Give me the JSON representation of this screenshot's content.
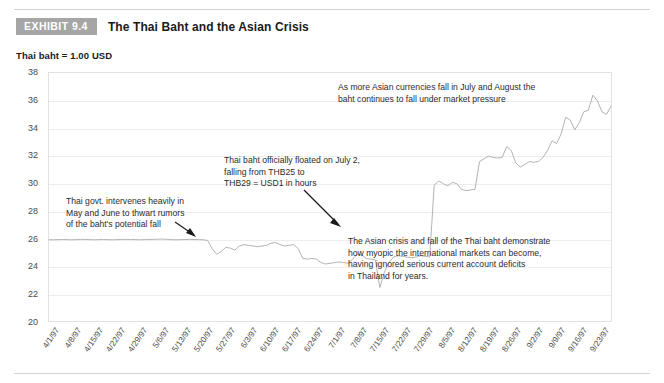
{
  "header": {
    "badge": "EXHIBIT 9.4",
    "title": "The Thai Baht and the Asian Crisis"
  },
  "axis_unit_label": "Thai baht = 1.00 USD",
  "annotations": {
    "july_august": "As more Asian currencies fall in July and August the\nbaht continues to fall under market pressure",
    "float": "Thai baht officially floated on July 2,\nfalling from THB25 to\nTHB29 = USD1 in hours",
    "intervene": "Thai govt. intervenes heavily in\nMay and June to thwart rumors\nof the baht's potential fall",
    "myopic": "The Asian crisis and fall of the Thai baht demonstrate\nhow myopic the international markets can become,\nhaving ignored serious current account deficits\nin Thailand for years."
  },
  "chart_data": {
    "type": "line",
    "title": "The Thai Baht and the Asian Crisis",
    "xlabel": "",
    "ylabel": "Thai baht = 1.00 USD",
    "ylim": [
      20,
      38
    ],
    "ytick_step": 2,
    "yticks": [
      20,
      22,
      24,
      26,
      28,
      30,
      32,
      34,
      36,
      38
    ],
    "grid": true,
    "legend": "none",
    "line_color": "#b3b3b3",
    "xtick_labels": [
      "4/1/97",
      "4/8/97",
      "4/15/97",
      "4/22/97",
      "4/29/97",
      "5/6/97",
      "5/13/97",
      "5/20/97",
      "5/27/97",
      "6/3/97",
      "6/10/97",
      "6/17/97",
      "6/24/97",
      "7/1/97",
      "7/8/97",
      "7/15/97",
      "7/22/97",
      "7/29/97",
      "8/5/97",
      "8/12/97",
      "8/19/97",
      "8/26/97",
      "9/2/97",
      "9/9/97",
      "9/16/97",
      "9/23/97"
    ],
    "x": [
      0,
      1,
      2,
      3,
      4,
      5,
      6,
      7,
      8,
      9,
      10,
      11,
      12,
      13,
      14,
      15,
      16,
      17,
      18,
      19,
      20,
      21,
      22,
      23,
      24,
      25,
      26,
      27,
      28,
      29,
      30,
      31,
      32,
      33,
      34,
      35,
      36,
      37,
      38,
      39,
      40,
      41,
      42,
      43,
      44,
      45,
      46,
      47,
      48,
      49,
      50,
      51,
      52,
      53,
      54,
      55,
      56,
      57,
      58,
      59,
      60,
      61,
      62,
      63,
      64,
      65,
      66,
      67,
      68,
      69,
      70,
      71,
      72,
      73,
      74,
      75,
      76,
      77,
      78,
      79,
      80,
      81,
      82,
      83,
      84,
      85,
      86,
      87,
      88,
      89,
      90,
      91,
      92,
      93,
      94,
      95,
      96,
      97,
      98,
      99,
      100,
      101,
      102,
      103,
      104,
      105,
      106,
      107,
      108,
      109,
      110,
      111,
      112,
      113,
      114,
      115,
      116,
      117,
      118,
      119,
      120,
      121,
      122,
      123,
      124
    ],
    "values": [
      25.95,
      25.95,
      25.96,
      25.97,
      25.96,
      25.95,
      25.96,
      25.98,
      25.97,
      25.96,
      25.95,
      25.96,
      25.97,
      25.96,
      25.95,
      25.96,
      25.97,
      25.98,
      25.97,
      25.96,
      25.95,
      25.96,
      25.97,
      25.98,
      25.99,
      26.0,
      25.98,
      25.96,
      25.95,
      25.96,
      25.97,
      25.98,
      25.97,
      25.96,
      25.95,
      25.9,
      25.3,
      24.9,
      25.1,
      25.4,
      25.35,
      25.2,
      25.5,
      25.6,
      25.55,
      25.5,
      25.45,
      25.5,
      25.55,
      25.7,
      25.75,
      25.6,
      25.5,
      25.55,
      25.6,
      25.3,
      24.6,
      24.55,
      24.6,
      24.55,
      24.3,
      24.2,
      24.25,
      24.3,
      24.35,
      24.3,
      24.25,
      24.55,
      24.9,
      24.85,
      24.6,
      24.55,
      24.5,
      22.5,
      23.6,
      24.3,
      24.7,
      24.8,
      24.75,
      24.7,
      24.65,
      24.7,
      24.8,
      24.75,
      24.7,
      29.9,
      30.2,
      30.0,
      29.85,
      30.1,
      30.0,
      29.6,
      29.5,
      29.55,
      29.6,
      31.6,
      31.8,
      32.0,
      31.9,
      31.85,
      31.9,
      32.7,
      32.4,
      31.5,
      31.2,
      31.4,
      31.6,
      31.55,
      31.6,
      31.9,
      32.4,
      33.1,
      32.9,
      33.6,
      34.8,
      34.6,
      33.9,
      34.4,
      35.2,
      35.3,
      36.4,
      36.0,
      35.2,
      35.0,
      35.6
    ]
  }
}
